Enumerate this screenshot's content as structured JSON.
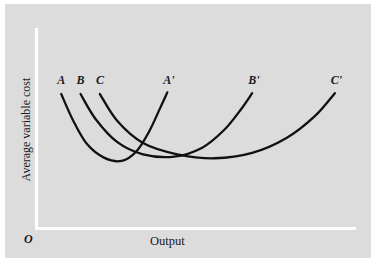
{
  "figure": {
    "background_color": "#dcdcdc",
    "page_color": "#ffffff",
    "axis_color": "#ffffff",
    "curve_color": "#111111",
    "text_color": "#1a1a1a",
    "origin_label": "O"
  },
  "chart_data": {
    "type": "line",
    "title": "",
    "subtitle": "",
    "xlabel": "Output",
    "ylabel": "Average variable cost",
    "grid": false,
    "legend": "none",
    "annotations": [
      "O"
    ],
    "axis_style": "white L-shaped axes without tick marks or numeric scale",
    "xlim": [
      0,
      1
    ],
    "ylim": [
      0,
      1
    ],
    "series": [
      {
        "name": "A-A'",
        "start_label": "A",
        "end_label": "A'",
        "description": "Short-run average variable cost curve for smallest plant; U-shaped with leftmost and lowest-output minimum",
        "points": [
          {
            "x": 0.068,
            "y": 0.795
          },
          {
            "x": 0.105,
            "y": 0.64
          },
          {
            "x": 0.15,
            "y": 0.495
          },
          {
            "x": 0.205,
            "y": 0.412
          },
          {
            "x": 0.262,
            "y": 0.392
          },
          {
            "x": 0.31,
            "y": 0.452
          },
          {
            "x": 0.35,
            "y": 0.57
          },
          {
            "x": 0.385,
            "y": 0.71
          },
          {
            "x": 0.408,
            "y": 0.805
          }
        ]
      },
      {
        "name": "B-B'",
        "start_label": "B",
        "end_label": "B'",
        "description": "Short-run average variable cost curve for medium plant; U-shaped, minimum at intermediate output",
        "points": [
          {
            "x": 0.13,
            "y": 0.795
          },
          {
            "x": 0.178,
            "y": 0.645
          },
          {
            "x": 0.248,
            "y": 0.505
          },
          {
            "x": 0.33,
            "y": 0.432
          },
          {
            "x": 0.43,
            "y": 0.418
          },
          {
            "x": 0.52,
            "y": 0.472
          },
          {
            "x": 0.59,
            "y": 0.578
          },
          {
            "x": 0.645,
            "y": 0.705
          },
          {
            "x": 0.68,
            "y": 0.8
          }
        ]
      },
      {
        "name": "C-C'",
        "start_label": "C",
        "end_label": "C'",
        "description": "Short-run average variable cost curve for largest plant; flattest U-shape with minimum at highest output",
        "points": [
          {
            "x": 0.192,
            "y": 0.795
          },
          {
            "x": 0.248,
            "y": 0.632
          },
          {
            "x": 0.33,
            "y": 0.5
          },
          {
            "x": 0.44,
            "y": 0.432
          },
          {
            "x": 0.56,
            "y": 0.408
          },
          {
            "x": 0.68,
            "y": 0.44
          },
          {
            "x": 0.79,
            "y": 0.53
          },
          {
            "x": 0.88,
            "y": 0.66
          },
          {
            "x": 0.945,
            "y": 0.8
          }
        ]
      }
    ],
    "curve_labels": [
      {
        "text": "A",
        "x": 0.068,
        "y": 0.88
      },
      {
        "text": "B",
        "x": 0.13,
        "y": 0.88
      },
      {
        "text": "C",
        "x": 0.192,
        "y": 0.88
      },
      {
        "text": "A'",
        "x": 0.408,
        "y": 0.88
      },
      {
        "text": "B'",
        "x": 0.68,
        "y": 0.88
      },
      {
        "text": "C'",
        "x": 0.945,
        "y": 0.88
      }
    ]
  },
  "labels": {
    "y_axis": "Average variable cost",
    "x_axis": "Output",
    "origin": "O",
    "a": "A",
    "b": "B",
    "c": "C",
    "a_prime": "A'",
    "b_prime": "B'",
    "c_prime": "C'"
  }
}
